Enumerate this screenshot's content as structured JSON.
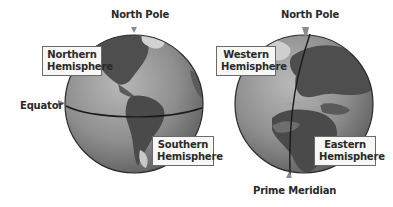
{
  "diagram": {
    "left_globe": {
      "top_label": "North Pole",
      "side_label": "Equator",
      "upper_box": [
        "Northern",
        "Hemisphere"
      ],
      "lower_box": [
        "Southern",
        "Hemisphere"
      ],
      "divider": "Equator"
    },
    "right_globe": {
      "top_label": "North Pole",
      "bottom_label": "Prime Meridian",
      "left_box": [
        "Western",
        "Hemisphere"
      ],
      "right_box": [
        "Eastern",
        "Hemisphere"
      ],
      "divider": "Prime Meridian"
    }
  },
  "colors": {
    "ocean": "#8c8c8c",
    "land_dark": "#4e4e4e",
    "land_light": "#a8a8a8",
    "outline": "#2a2a2a",
    "box_bg": "#f7f7f5",
    "arrow": "#8a8a8a"
  }
}
